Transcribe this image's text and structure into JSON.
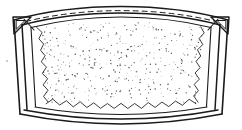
{
  "figure": {
    "title": "Trapezoidal framed mesh panel",
    "style": "black-and-white technical line drawing",
    "background_color": "#ffffff",
    "ink_color": "#1a1a1a",
    "stipple_color": "#555555",
    "width_px": 242,
    "height_px": 130,
    "caption": "",
    "label": "",
    "reference_numerals": []
  },
  "parts": {
    "outer_frame": {
      "name": "outer-frame",
      "description": "Outermost double-line trapezoidal rail with arched top and bowed bottom",
      "stroke_width": 1.4
    },
    "top_rail": {
      "name": "top-rail",
      "description": "Upward-arched top band formed by two parallel curves",
      "has_dashed_center_line": true,
      "dash_pattern": "5 4"
    },
    "bottom_rail": {
      "name": "bottom-rail",
      "description": "Downward-bowed bottom band formed by two parallel curves",
      "has_dashed_center_line": false
    },
    "left_rail": {
      "name": "left-rail",
      "description": "Left slanted double-line side rail",
      "slant": "outward at top"
    },
    "right_rail": {
      "name": "right-rail",
      "description": "Right slanted double-line side rail",
      "slant": "outward at top"
    },
    "corner_bracket_left": {
      "name": "corner-bracket-top-left",
      "description": "Triangular gusset bracket at top-left corner"
    },
    "corner_bracket_right": {
      "name": "corner-bracket-top-right",
      "description": "Triangular gusset bracket at top-right corner"
    },
    "mesh_panel": {
      "name": "mesh-panel",
      "description": "Stippled interior panel representing fabric or mesh",
      "fill_texture": "random stipple dots",
      "dot_count": 520
    },
    "stitch_border": {
      "name": "stitch-border",
      "description": "Zigzag stitching along left, right and bottom edges of mesh panel",
      "edges": [
        "left",
        "right",
        "bottom"
      ],
      "zigzag_segments_bottom": 22,
      "zigzag_segments_side": 13
    },
    "speck": {
      "name": "stray-speck",
      "description": "Small isolated ink speck at lower-left of drawing"
    }
  }
}
